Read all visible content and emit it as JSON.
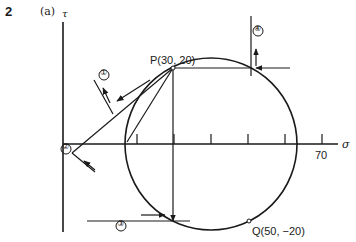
{
  "figure": {
    "problem_number": "2",
    "part_label": "(a)",
    "axes": {
      "x_label": "σ",
      "y_label": "τ",
      "x_tick_label": "70"
    },
    "points": {
      "P": {
        "label": "P(30, 20)"
      },
      "Q": {
        "label": "Q(50, −20)"
      }
    },
    "markers": [
      "①",
      "②",
      "③",
      "④"
    ],
    "colors": {
      "ink": "#1a1a1a",
      "background": "#ffffff"
    }
  }
}
